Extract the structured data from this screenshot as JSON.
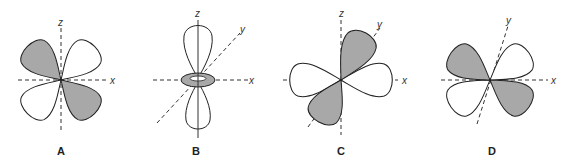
{
  "figure": {
    "colors": {
      "shaded_lobe": "#a8a8a8",
      "open_lobe": "#ffffff",
      "outline": "#222222",
      "axis": "#333333"
    },
    "panels": [
      {
        "label": "A",
        "axes": {
          "x": "x",
          "z": "z"
        }
      },
      {
        "label": "B",
        "axes": {
          "x": "x",
          "y": "y",
          "z": "z"
        }
      },
      {
        "label": "C",
        "axes": {
          "x": "x",
          "y": "y",
          "z": "z"
        }
      },
      {
        "label": "D",
        "axes": {
          "x": "x",
          "y": "y"
        }
      }
    ]
  }
}
